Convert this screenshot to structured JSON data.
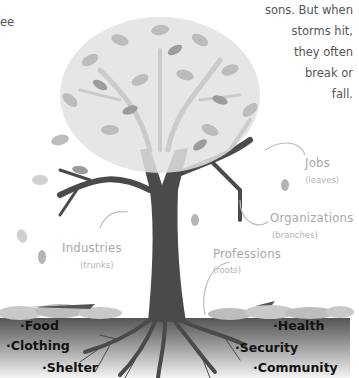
{
  "intro_text_fragment": {
    "left_partial": "ee",
    "right_lines": [
      "sons. But when",
      "storms hit,",
      "they often",
      "break or",
      "fall."
    ]
  },
  "tree_labels": {
    "jobs": {
      "label": "Jobs",
      "sub": "(leaves)"
    },
    "organizations": {
      "label": "Organizations",
      "sub": "(branches)"
    },
    "industries": {
      "label": "Industries",
      "sub": "(trunks)"
    },
    "professions": {
      "label": "Professions",
      "sub": "(roots)"
    }
  },
  "needs_left": [
    "·Food",
    "·Clothing",
    "·Shelter"
  ],
  "needs_right": [
    "·Health",
    "·Security",
    "·Community"
  ],
  "colors": {
    "trunk": "#4a4a4a",
    "leaf_light": "#d9d9d9",
    "leaf_mid": "#b8b8b8",
    "leaf_dark": "#999999",
    "label": "#a8a8a8",
    "ground_top": "#5a5a5a",
    "ground_bottom": "#f2f2f2"
  }
}
